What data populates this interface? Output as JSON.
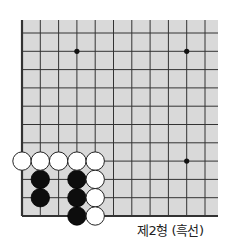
{
  "diagram": {
    "title": "제2형 (흑선)",
    "board": {
      "visible_cols": 11,
      "visible_rows": 11,
      "background": "#d9d9d9",
      "line_color": "#333333",
      "edges": [
        "left",
        "bottom"
      ],
      "star_points": [
        [
          3,
          9
        ],
        [
          9,
          9
        ],
        [
          9,
          3
        ]
      ]
    },
    "stones": {
      "white": [
        [
          0,
          3
        ],
        [
          1,
          3
        ],
        [
          2,
          3
        ],
        [
          3,
          3
        ],
        [
          4,
          3
        ],
        [
          4,
          2
        ],
        [
          4,
          1
        ],
        [
          4,
          0
        ]
      ],
      "black": [
        [
          1,
          2
        ],
        [
          1,
          1
        ],
        [
          3,
          2
        ],
        [
          3,
          1
        ],
        [
          3,
          0
        ]
      ]
    },
    "colors": {
      "black": "#0d0d0d",
      "white": "#ffffff"
    }
  }
}
